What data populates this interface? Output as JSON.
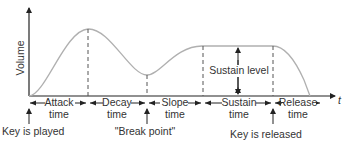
{
  "diagram": {
    "type": "ADSR envelope",
    "y_axis_label": "Volume",
    "x_axis_label": "t",
    "sustain_level_label": "Sustain level",
    "phases": [
      {
        "line1": "Attack",
        "line2": "time"
      },
      {
        "line1": "Decay",
        "line2": "time"
      },
      {
        "line1": "Slope",
        "line2": "time"
      },
      {
        "line1": "Sustain",
        "line2": "time"
      },
      {
        "line1": "Release",
        "line2": "time"
      }
    ],
    "events": {
      "key_played": "Key is played",
      "break_point": "\"Break point\"",
      "key_released": "Key is released"
    },
    "colors": {
      "curve": "#b0b0b0",
      "axis": "#222222",
      "dashed": "#555555",
      "text": "#333333"
    }
  }
}
